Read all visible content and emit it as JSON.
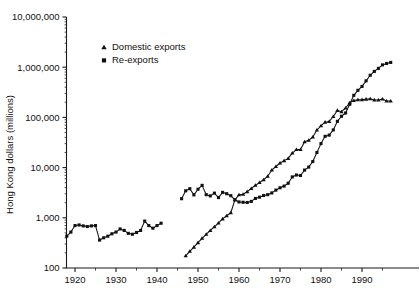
{
  "chart_data": {
    "type": "line",
    "title": "",
    "xlabel": "",
    "ylabel": "Hong Kong dollars (millions)",
    "yscale": "log",
    "ylim": [
      100,
      10000000
    ],
    "xlim": [
      1918,
      1998
    ],
    "grid": false,
    "legend_position": "upper-left-inside",
    "ytick_labels": [
      "10,000,000",
      "1,000,000",
      "100,000",
      "10,000",
      "1,000",
      "100"
    ],
    "ytick_values": [
      10000000,
      1000000,
      100000,
      10000,
      1000,
      100
    ],
    "xtick_labels": [
      "1920",
      "1930",
      "1940",
      "1950",
      "1960",
      "1970",
      "1980",
      "1990"
    ],
    "xtick_values": [
      1920,
      1930,
      1940,
      1950,
      1960,
      1970,
      1980,
      1990
    ],
    "series": [
      {
        "name": "Domestic exports",
        "marker": "triangle",
        "color": "#111111",
        "x": [
          1947,
          1948,
          1949,
          1950,
          1951,
          1952,
          1953,
          1954,
          1955,
          1956,
          1957,
          1958,
          1959,
          1960,
          1961,
          1962,
          1963,
          1964,
          1965,
          1966,
          1967,
          1968,
          1969,
          1970,
          1971,
          1972,
          1973,
          1974,
          1975,
          1976,
          1977,
          1978,
          1979,
          1980,
          1981,
          1982,
          1983,
          1984,
          1985,
          1986,
          1987,
          1988,
          1989,
          1990,
          1991,
          1992,
          1993,
          1994,
          1995,
          1996,
          1997
        ],
        "y": [
          175,
          215,
          260,
          320,
          390,
          470,
          560,
          660,
          790,
          950,
          1100,
          1260,
          2280,
          2870,
          2940,
          3320,
          3830,
          4430,
          5030,
          5730,
          6700,
          8930,
          10520,
          12350,
          13750,
          15250,
          19470,
          22910,
          22860,
          32630,
          35000,
          40710,
          55910,
          68170,
          80420,
          83030,
          104400,
          137900,
          129800,
          153980,
          195520,
          217700,
          224100,
          225900,
          231000,
          234100,
          223000,
          222100,
          231700,
          212200,
          211400
        ]
      },
      {
        "name": "Re-exports",
        "marker": "square",
        "color": "#111111",
        "x": [
          1918,
          1919,
          1920,
          1921,
          1922,
          1923,
          1924,
          1925,
          1926,
          1927,
          1928,
          1929,
          1930,
          1931,
          1932,
          1933,
          1934,
          1935,
          1936,
          1937,
          1938,
          1939,
          1940,
          1941,
          1946,
          1947,
          1948,
          1949,
          1950,
          1951,
          1952,
          1953,
          1954,
          1955,
          1956,
          1957,
          1958,
          1959,
          1960,
          1961,
          1962,
          1963,
          1964,
          1965,
          1966,
          1967,
          1968,
          1969,
          1970,
          1971,
          1972,
          1973,
          1974,
          1975,
          1976,
          1977,
          1978,
          1979,
          1980,
          1981,
          1982,
          1983,
          1984,
          1985,
          1986,
          1987,
          1988,
          1989,
          1990,
          1991,
          1992,
          1993,
          1994,
          1995,
          1996,
          1997
        ],
        "y": [
          430,
          520,
          700,
          720,
          690,
          670,
          690,
          700,
          360,
          400,
          430,
          480,
          520,
          600,
          560,
          490,
          470,
          510,
          560,
          860,
          700,
          620,
          700,
          780,
          2400,
          3450,
          3800,
          2860,
          3710,
          4430,
          2890,
          2730,
          3100,
          2530,
          3210,
          3020,
          2760,
          2280,
          2070,
          2040,
          2020,
          2120,
          2430,
          2580,
          2780,
          2890,
          3130,
          3560,
          3960,
          4280,
          4880,
          6520,
          7120,
          6970,
          8930,
          10240,
          13200,
          20020,
          30070,
          41960,
          44350,
          56300,
          83500,
          105300,
          122500,
          182800,
          275200,
          346400,
          413900,
          534800,
          690800,
          823200,
          947900,
          1112500,
          1185800,
          1244500
        ]
      }
    ],
    "annotations": []
  },
  "legend": {
    "entries": [
      {
        "label": "Domestic exports",
        "marker": "triangle"
      },
      {
        "label": "Re-exports",
        "marker": "square"
      }
    ]
  },
  "axes": {
    "y_title": "Hong Kong dollars (millions)"
  }
}
